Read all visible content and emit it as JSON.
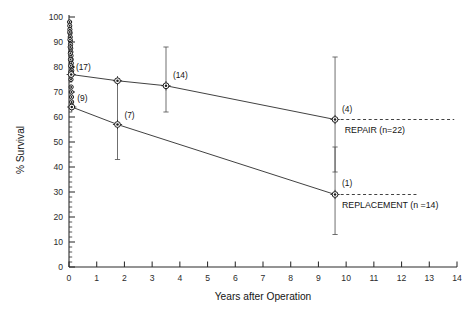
{
  "chart_data": {
    "type": "line",
    "title": "",
    "xlabel": "Years after Operation",
    "ylabel": "% Survival",
    "xlim": [
      0,
      14
    ],
    "ylim": [
      0,
      100
    ],
    "xticks": [
      0,
      1,
      2,
      3,
      4,
      5,
      6,
      7,
      8,
      9,
      10,
      11,
      12,
      13,
      14
    ],
    "xtick_labels": [
      "0",
      "1",
      "2",
      "3",
      "4",
      "5",
      "6",
      "7",
      "8",
      "9",
      "10",
      "11",
      "12",
      "13",
      "14"
    ],
    "yticks": [
      0,
      10,
      20,
      30,
      40,
      50,
      60,
      70,
      80,
      90,
      100
    ],
    "ytick_labels": [
      "0",
      "10",
      "20",
      "30",
      "40",
      "50",
      "60",
      "70",
      "80",
      "90",
      "100"
    ],
    "grid": false,
    "legend_position": "right-inline",
    "series": [
      {
        "name": "REPAIR",
        "label": "REPAIR (n=22)",
        "n": 22,
        "x": [
          0.08,
          1.75,
          3.5,
          9.6
        ],
        "y": [
          77,
          74.5,
          72.5,
          59
        ],
        "at_risk_labels": [
          "(17)",
          "",
          "(14)",
          "(4)"
        ],
        "errorbars": [
          {
            "x": 3.5,
            "y": 72.5,
            "low": 62,
            "high": 88
          },
          {
            "x": 9.6,
            "y": 59,
            "low": 38,
            "high": 84
          }
        ],
        "dashed_extension": {
          "from_x": 9.6,
          "to_x": 13.9,
          "y": 59
        }
      },
      {
        "name": "REPLACEMENT",
        "label": "REPLACEMENT (n =14)",
        "n": 14,
        "x": [
          0.1,
          1.75,
          9.6
        ],
        "y": [
          64,
          57,
          29
        ],
        "at_risk_labels": [
          "(9)",
          "(7)",
          "(1)"
        ],
        "errorbars": [
          {
            "x": 1.75,
            "y": 57,
            "low": 43,
            "high": 74
          },
          {
            "x": 9.6,
            "y": 29,
            "low": 13,
            "high": 48
          }
        ],
        "dashed_extension": {
          "from_x": 9.6,
          "to_x": 12.6,
          "y": 29
        }
      }
    ],
    "early_cluster": {
      "description": "dense stepped survival points near time zero",
      "repair_y": [
        98,
        96.5,
        95,
        93.5,
        92,
        90.5,
        89,
        87.5,
        86,
        84.5,
        83,
        81.5,
        80,
        78.5,
        77
      ],
      "replacement_y": [
        94,
        91,
        88,
        85.5,
        83,
        80.5,
        78,
        75,
        72,
        70,
        68,
        66,
        64
      ]
    },
    "annotations": [
      {
        "text": "(17)",
        "x": 0.25,
        "y": 79
      },
      {
        "text": "(9)",
        "x": 0.3,
        "y": 66.5
      },
      {
        "text": "(7)",
        "x": 2.0,
        "y": 59.5
      },
      {
        "text": "(14)",
        "x": 3.75,
        "y": 75.5
      },
      {
        "text": "(4)",
        "x": 9.85,
        "y": 62
      },
      {
        "text": "(1)",
        "x": 9.85,
        "y": 32.5
      }
    ]
  }
}
